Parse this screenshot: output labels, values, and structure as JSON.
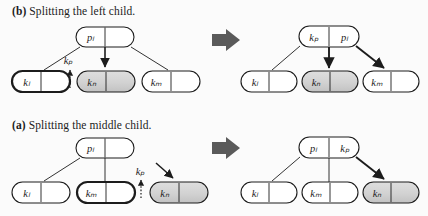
{
  "figure": {
    "background_color": "#fbfbfb",
    "ink_color": "#1c1c1c",
    "shade_color": "#d2d2d2",
    "arrow_color": "#5a5a5a",
    "panels": [
      {
        "id": "panel-b",
        "caption_label": "(b)",
        "caption_text": "Splitting the left child.",
        "before": {
          "parent": {
            "keys": [
              "p",
              "l"
            ],
            "key_text": "pₗ",
            "shaded": false,
            "bold": false
          },
          "children": [
            {
              "key_text": "kₗ",
              "shaded": false,
              "bold": true
            },
            {
              "key_text": "kₙ",
              "shaded": true,
              "bold": false
            },
            {
              "key_text": "kₘ",
              "shaded": false,
              "bold": false
            }
          ],
          "annotation": {
            "label": "kₚ",
            "style": "dotted-up-arrow"
          }
        },
        "after": {
          "parent": {
            "key_text_left": "kₚ",
            "key_text_right": "pₗ",
            "shaded": false,
            "bold": false
          },
          "children": [
            {
              "key_text": "kₗ",
              "shaded": false,
              "bold": false
            },
            {
              "key_text": "kₙ",
              "shaded": true,
              "bold": false
            },
            {
              "key_text": "kₘ",
              "shaded": false,
              "bold": false
            }
          ]
        }
      },
      {
        "id": "panel-a",
        "caption_label": "(a)",
        "caption_text": "Splitting the middle child.",
        "before": {
          "parent": {
            "key_text": "pₗ",
            "shaded": false,
            "bold": false
          },
          "children": [
            {
              "key_text": "kₗ",
              "shaded": false,
              "bold": false
            },
            {
              "key_text": "kₘ",
              "shaded": false,
              "bold": true
            },
            {
              "key_text": "kₙ",
              "shaded": true,
              "bold": false
            }
          ],
          "annotation": {
            "label": "kₚ",
            "style": "dotted-up-arrow"
          }
        },
        "after": {
          "parent": {
            "key_text_left": "pₗ",
            "key_text_right": "kₚ",
            "shaded": false,
            "bold": false
          },
          "children": [
            {
              "key_text": "kₗ",
              "shaded": false,
              "bold": false
            },
            {
              "key_text": "kₘ",
              "shaded": false,
              "bold": false
            },
            {
              "key_text": "kₙ",
              "shaded": true,
              "bold": false
            }
          ]
        }
      }
    ],
    "transform_arrow": {
      "name": "right-block-arrow",
      "direction": "right"
    }
  }
}
